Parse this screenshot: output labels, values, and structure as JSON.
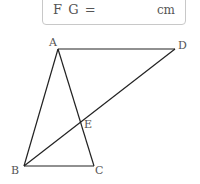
{
  "answer": {
    "label": "F G =",
    "unit": "cm",
    "value": ""
  },
  "figure": {
    "points": {
      "A": {
        "label": "A",
        "x": 58,
        "y": 49
      },
      "B": {
        "label": "B",
        "x": 24,
        "y": 166
      },
      "C": {
        "label": "C",
        "x": 94,
        "y": 166
      },
      "D": {
        "label": "D",
        "x": 175,
        "y": 49
      },
      "E": {
        "label": "E",
        "x": 81,
        "y": 120
      }
    },
    "segments": [
      "AB",
      "AC",
      "BC",
      "AD",
      "BD"
    ],
    "line_color": "#222222"
  }
}
